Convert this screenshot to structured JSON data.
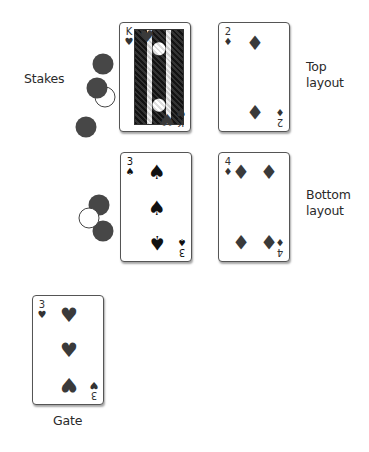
{
  "labels": {
    "stakes": "Stakes",
    "top_layout_line1": "Top",
    "top_layout_line2": "layout",
    "bottom_layout_line1": "Bottom",
    "bottom_layout_line2": "layout",
    "gate": "Gate"
  },
  "cards": {
    "top_stake_card": {
      "rank": "K",
      "suit": "♥",
      "suit_name": "hearts"
    },
    "top_layout_card": {
      "rank": "2",
      "suit": "♦",
      "suit_name": "diamonds"
    },
    "bottom_stake_card": {
      "rank": "3",
      "suit": "♠",
      "suit_name": "spades"
    },
    "bottom_layout_card": {
      "rank": "4",
      "suit": "♦",
      "suit_name": "diamonds"
    },
    "gate_card": {
      "rank": "3",
      "suit": "♥",
      "suit_name": "hearts"
    }
  },
  "chips": {
    "top_group": [
      "dark",
      "dark",
      "outline",
      "dark"
    ],
    "bottom_group": [
      "dark",
      "light",
      "dark"
    ]
  },
  "colors": {
    "chip_dark": "#474747",
    "card_border": "#555555",
    "background": "#ffffff"
  }
}
